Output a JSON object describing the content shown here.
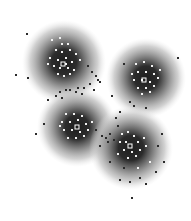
{
  "chart_data": {
    "type": "scatter",
    "title": "",
    "xlabel": "",
    "ylabel": "",
    "grid": false,
    "legend": null,
    "axes_visible": false,
    "clusters": [
      {
        "id": 1,
        "center": [
          64,
          62
        ],
        "radius": 42,
        "centroid_marker": [
          63,
          64
        ]
      },
      {
        "id": 2,
        "center": [
          146,
          78
        ],
        "radius": 40,
        "centroid_marker": [
          144,
          80
        ]
      },
      {
        "id": 3,
        "center": [
          77,
          127
        ],
        "radius": 40,
        "centroid_marker": [
          77,
          127
        ]
      },
      {
        "id": 4,
        "center": [
          131,
          148
        ],
        "radius": 42,
        "centroid_marker": [
          130,
          146
        ]
      }
    ],
    "inner_points": [
      [
        52,
        40
      ],
      [
        60,
        38
      ],
      [
        68,
        44
      ],
      [
        56,
        50
      ],
      [
        62,
        52
      ],
      [
        70,
        50
      ],
      [
        76,
        54
      ],
      [
        50,
        58
      ],
      [
        58,
        60
      ],
      [
        66,
        58
      ],
      [
        72,
        62
      ],
      [
        54,
        66
      ],
      [
        60,
        68
      ],
      [
        68,
        68
      ],
      [
        74,
        70
      ],
      [
        58,
        74
      ],
      [
        64,
        76
      ],
      [
        70,
        74
      ],
      [
        48,
        64
      ],
      [
        80,
        60
      ],
      [
        62,
        44
      ],
      [
        66,
        64
      ],
      [
        136,
        64
      ],
      [
        144,
        62
      ],
      [
        152,
        66
      ],
      [
        138,
        72
      ],
      [
        146,
        72
      ],
      [
        154,
        74
      ],
      [
        134,
        80
      ],
      [
        142,
        80
      ],
      [
        150,
        82
      ],
      [
        158,
        78
      ],
      [
        138,
        88
      ],
      [
        146,
        88
      ],
      [
        154,
        86
      ],
      [
        142,
        94
      ],
      [
        150,
        92
      ],
      [
        132,
        74
      ],
      [
        160,
        70
      ],
      [
        66,
        114
      ],
      [
        74,
        114
      ],
      [
        82,
        116
      ],
      [
        62,
        122
      ],
      [
        70,
        122
      ],
      [
        78,
        120
      ],
      [
        86,
        124
      ],
      [
        64,
        130
      ],
      [
        72,
        130
      ],
      [
        80,
        132
      ],
      [
        88,
        130
      ],
      [
        68,
        138
      ],
      [
        76,
        138
      ],
      [
        84,
        136
      ],
      [
        60,
        126
      ],
      [
        92,
        122
      ],
      [
        122,
        134
      ],
      [
        128,
        132
      ],
      [
        134,
        136
      ],
      [
        120,
        142
      ],
      [
        126,
        142
      ],
      [
        138,
        142
      ],
      [
        124,
        150
      ],
      [
        132,
        152
      ],
      [
        140,
        150
      ],
      [
        118,
        154
      ],
      [
        128,
        158
      ],
      [
        136,
        156
      ],
      [
        146,
        146
      ],
      [
        138,
        168
      ],
      [
        150,
        162
      ],
      [
        144,
        138
      ]
    ],
    "outer_points": [
      [
        27,
        34
      ],
      [
        16,
        75
      ],
      [
        28,
        78
      ],
      [
        88,
        66
      ],
      [
        92,
        72
      ],
      [
        96,
        76
      ],
      [
        90,
        84
      ],
      [
        98,
        80
      ],
      [
        94,
        90
      ],
      [
        84,
        88
      ],
      [
        100,
        82
      ],
      [
        78,
        88
      ],
      [
        70,
        90
      ],
      [
        60,
        92
      ],
      [
        56,
        96
      ],
      [
        62,
        98
      ],
      [
        66,
        90
      ],
      [
        48,
        100
      ],
      [
        76,
        92
      ],
      [
        82,
        94
      ],
      [
        124,
        64
      ],
      [
        178,
        58
      ],
      [
        130,
        102
      ],
      [
        134,
        106
      ],
      [
        146,
        108
      ],
      [
        112,
        96
      ],
      [
        44,
        124
      ],
      [
        36,
        134
      ],
      [
        116,
        118
      ],
      [
        120,
        112
      ],
      [
        102,
        136
      ],
      [
        106,
        138
      ],
      [
        110,
        134
      ],
      [
        114,
        140
      ],
      [
        100,
        146
      ],
      [
        108,
        142
      ],
      [
        96,
        130
      ],
      [
        118,
        126
      ],
      [
        162,
        134
      ],
      [
        158,
        146
      ],
      [
        164,
        162
      ],
      [
        156,
        172
      ],
      [
        140,
        178
      ],
      [
        130,
        182
      ],
      [
        120,
        180
      ],
      [
        132,
        198
      ],
      [
        146,
        184
      ],
      [
        124,
        168
      ],
      [
        110,
        162
      ]
    ],
    "colors": {
      "background": "#ffffff",
      "density_core": "#1e1e1e",
      "density_edge": "#e8e8e8",
      "inner_point": "#f2f2f2",
      "outer_point": "#2a2a2a"
    }
  }
}
